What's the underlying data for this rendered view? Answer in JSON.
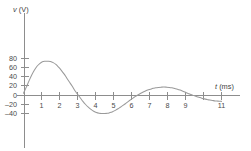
{
  "chart_data": {
    "type": "line",
    "title": "",
    "subtitle": "",
    "xlabel": "t (ms)",
    "ylabel": "v (V)",
    "xlabel_var": "t",
    "xlabel_unit": "(ms)",
    "ylabel_var": "v",
    "ylabel_unit": "(V)",
    "grid": false,
    "legend": "none",
    "xlim": [
      0,
      11.6
    ],
    "ylim": [
      -52,
      88
    ],
    "xticks": [
      1,
      2,
      3,
      4,
      5,
      6,
      7,
      8,
      9,
      10,
      11
    ],
    "xtick_labels": [
      "1",
      "2",
      "3",
      "4",
      "5",
      "6",
      "7",
      "8",
      "9",
      "",
      "11"
    ],
    "yticks": [
      -40,
      -20,
      0,
      20,
      40,
      60,
      80
    ],
    "ytick_labels": [
      "–40",
      "–20",
      "0",
      "20",
      "40",
      "60",
      "80"
    ],
    "series": [
      {
        "name": "v(t)",
        "color": "#9a9a9a",
        "x": [
          0.0,
          0.15,
          0.3,
          0.45,
          0.6,
          0.75,
          0.9,
          1.05,
          1.2,
          1.35,
          1.5,
          1.65,
          1.8,
          1.95,
          2.1,
          2.25,
          2.4,
          2.55,
          2.7,
          2.85,
          3.0,
          3.15,
          3.3,
          3.45,
          3.6,
          3.75,
          3.9,
          4.05,
          4.2,
          4.35,
          4.5,
          4.65,
          4.8,
          4.95,
          5.1,
          5.25,
          5.4,
          5.55,
          5.7,
          5.85,
          6.0,
          6.15,
          6.3,
          6.45,
          6.6,
          6.75,
          6.9,
          7.05,
          7.2,
          7.35,
          7.5,
          7.65,
          7.8,
          7.95,
          8.1,
          8.25,
          8.4,
          8.55,
          8.7,
          8.85,
          9.0,
          9.15,
          9.3,
          9.45,
          9.6,
          9.75,
          9.9,
          10.05,
          10.2,
          10.35,
          10.5,
          10.65,
          10.8,
          10.95,
          11.0
        ],
        "y": [
          5.0,
          18.0,
          32.0,
          45.0,
          56.0,
          65.0,
          71.0,
          75.0,
          76.0,
          76.0,
          75.5,
          73.0,
          69.0,
          63.0,
          56.0,
          48.0,
          39.0,
          30.0,
          21.0,
          11.0,
          3.0,
          -5.0,
          -13.0,
          -20.0,
          -26.0,
          -31.0,
          -35.0,
          -38.0,
          -39.5,
          -40.0,
          -40.0,
          -39.5,
          -38.0,
          -36.0,
          -33.0,
          -29.5,
          -25.5,
          -21.5,
          -17.0,
          -12.5,
          -8.0,
          -4.0,
          0.0,
          3.5,
          6.5,
          9.5,
          12.0,
          14.0,
          16.0,
          17.0,
          18.0,
          18.5,
          18.8,
          18.5,
          18.0,
          17.0,
          15.5,
          14.0,
          12.0,
          9.5,
          7.0,
          4.5,
          2.0,
          0.0,
          -2.0,
          -4.0,
          -6.0,
          -7.5,
          -9.0,
          -10.0,
          -11.0,
          -12.0,
          -12.5,
          -13.0,
          -13.0
        ],
        "key_points": {
          "start_value": 5,
          "first_peak_t": 1.45,
          "first_peak_v": 76,
          "first_zero_t": 3.1,
          "trough_t": 4.6,
          "trough_v": -40,
          "second_zero_t": 6.3,
          "second_peak_t": 7.8,
          "second_peak_v": 19,
          "third_zero_t": 9.45,
          "end_t": 11,
          "end_v": -13
        }
      }
    ]
  }
}
